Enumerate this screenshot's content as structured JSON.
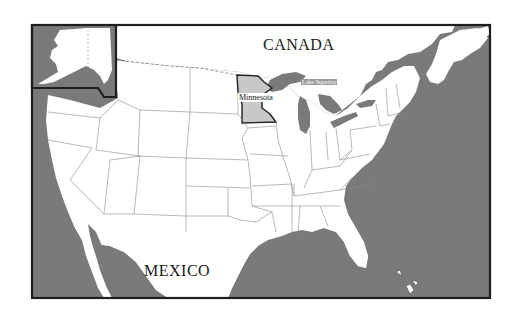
{
  "map": {
    "title": "United States map highlighting Minnesota",
    "colors": {
      "water": "#7a7a7a",
      "land": "#ffffff",
      "highlight_state": "#c8c8c8",
      "border": "#1e1e1e",
      "state_lines": "#8a8a8a"
    },
    "labels": {
      "canada": "CANADA",
      "mexico": "MEXICO",
      "highlighted_state": "Minnesota",
      "lake": "Lake Superior"
    },
    "insets": [
      {
        "name": "Alaska inset"
      }
    ],
    "highlighted_state": "Minnesota"
  }
}
